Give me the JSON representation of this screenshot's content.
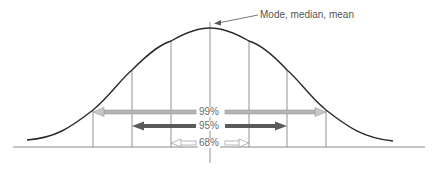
{
  "diagram": {
    "type": "normal-distribution",
    "annotation": "Mode, median, mean",
    "intervals": [
      {
        "label": "99%",
        "color": "#a9a9a9",
        "style": "light-outline"
      },
      {
        "label": "95%",
        "color": "#555555",
        "style": "dark-filled"
      },
      {
        "label": "68%",
        "color": "#c8c8c8",
        "style": "hollow"
      }
    ],
    "colors": {
      "curve": "#2a2a2a",
      "axis": "#888888",
      "gridline": "#777777",
      "text": "#666666"
    }
  }
}
